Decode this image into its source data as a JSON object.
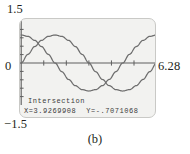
{
  "caption": "(b)",
  "axis_labels": {
    "y_max": "1.5",
    "y_min": "−1.5",
    "y_zero": "0",
    "x_max": "6.28"
  },
  "readout": {
    "title": "Intersection",
    "x_value": "X=3.9269908",
    "y_value": "Y=-.7071068"
  },
  "colors": {
    "curve": "#6e6e6e",
    "axis": "#555555",
    "screen_bg": "#f2f2f0",
    "screen_border": "#c9c9c6",
    "text": "#231f20"
  },
  "chart_data": {
    "type": "line",
    "title": "",
    "xlabel": "",
    "ylabel": "",
    "xlim": [
      0,
      6.28
    ],
    "ylim": [
      -1.5,
      1.5
    ],
    "grid": false,
    "legend": "none",
    "x_ticks": [
      1.0471976,
      2.0943951,
      3.1415927,
      4.1887902,
      5.2359878
    ],
    "y_ticks": [
      -1.2,
      -0.9,
      -0.6,
      -0.3,
      0.3,
      0.6,
      0.9,
      1.2
    ],
    "annotation": {
      "label": "Intersection",
      "x": 3.9269908,
      "y": -0.7071068
    },
    "series": [
      {
        "name": "y1",
        "expression": "cos(x)",
        "x": [
          0,
          0.3141593,
          0.6283185,
          0.9424778,
          1.2566371,
          1.5707963,
          1.8849556,
          2.1991149,
          2.5132741,
          2.8274334,
          3.1415927,
          3.4557519,
          3.7699112,
          4.0840704,
          4.3982297,
          4.712389,
          5.0265482,
          5.3407075,
          5.6548668,
          5.969026,
          6.2831853
        ],
        "y": [
          1,
          0.9510565,
          0.809017,
          0.5877853,
          0.309017,
          0,
          -0.309017,
          -0.5877853,
          -0.809017,
          -0.9510565,
          -1,
          -0.9510565,
          -0.809017,
          -0.5877853,
          -0.309017,
          0,
          0.309017,
          0.5877853,
          0.809017,
          0.9510565,
          1
        ]
      },
      {
        "name": "y2",
        "expression": "sin(x)",
        "x": [
          0,
          0.3141593,
          0.6283185,
          0.9424778,
          1.2566371,
          1.5707963,
          1.8849556,
          2.1991149,
          2.5132741,
          2.8274334,
          3.1415927,
          3.4557519,
          3.7699112,
          4.0840704,
          4.3982297,
          4.712389,
          5.0265482,
          5.3407075,
          5.6548668,
          5.969026,
          6.2831853
        ],
        "y": [
          0,
          0.309017,
          0.5877853,
          0.809017,
          0.9510565,
          1,
          0.9510565,
          0.809017,
          0.5877853,
          0.309017,
          0,
          -0.309017,
          -0.5877853,
          -0.809017,
          -0.9510565,
          -1,
          -0.9510565,
          -0.809017,
          -0.5877853,
          -0.309017,
          0
        ]
      }
    ]
  }
}
